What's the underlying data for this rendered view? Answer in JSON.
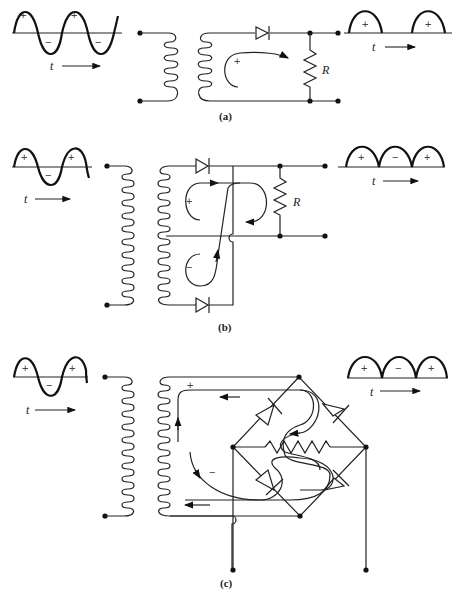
{
  "figure": {
    "panels": [
      {
        "id": "a",
        "caption": "(a)",
        "type": "half-wave rectifier",
        "input_wave": {
          "signs": [
            "+",
            "−",
            "+",
            "−"
          ],
          "time_label": "t"
        },
        "output_wave": {
          "signs": [
            "+",
            "+"
          ],
          "time_label": "t"
        },
        "resistor_label": "R",
        "loop_sign": "+"
      },
      {
        "id": "b",
        "caption": "(b)",
        "type": "center-tap full-wave rectifier",
        "input_wave": {
          "signs": [
            "+",
            "−",
            "+"
          ],
          "time_label": "t"
        },
        "output_wave": {
          "signs": [
            "+",
            "−",
            "+"
          ],
          "time_label": "t"
        },
        "resistor_label": "R",
        "loop_signs": [
          "+",
          "−"
        ]
      },
      {
        "id": "c",
        "caption": "(c)",
        "type": "bridge full-wave rectifier",
        "input_wave": {
          "signs": [
            "+",
            "−",
            "+"
          ],
          "time_label": "t"
        },
        "output_wave": {
          "signs": [
            "+",
            "−",
            "+"
          ],
          "time_label": "t"
        },
        "loop_signs": [
          "+",
          "−"
        ]
      }
    ]
  }
}
